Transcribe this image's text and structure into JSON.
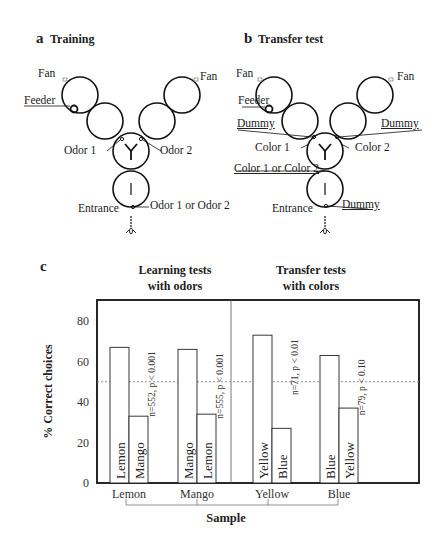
{
  "panel_a": {
    "letter": "a",
    "title": "Training",
    "labels": {
      "fan_left": "Fan",
      "fan_right": "Fan",
      "feeder": "Feeder",
      "odor1": "Odor 1",
      "odor2": "Odor 2",
      "entrance": "Entrance",
      "entrance_stim": "Odor 1 or Odor 2"
    }
  },
  "panel_b": {
    "letter": "b",
    "title": "Transfer test",
    "labels": {
      "fan_left": "Fan",
      "fan_right": "Fan",
      "feeder": "Feeder",
      "dummy_left": "Dummy",
      "dummy_right": "Dummy",
      "color1": "Color 1",
      "color2": "Color 2",
      "entrance_stim": "Color 1 or Color 2",
      "entrance": "Entrance",
      "entrance_dummy": "Dummy"
    }
  },
  "panel_c": {
    "letter": "c",
    "group_titles": {
      "left_line1": "Learning tests",
      "left_line2": "with odors",
      "right_line1": "Transfer tests",
      "right_line2": "with colors"
    }
  },
  "chart_data": {
    "type": "bar",
    "title": "",
    "xlabel": "Sample",
    "ylabel": "% Correct choices",
    "ylim": [
      0,
      90
    ],
    "yticks": [
      0,
      20,
      40,
      60,
      80
    ],
    "grid": false,
    "reference_line": {
      "y": 50,
      "style": "dashed"
    },
    "groups": [
      {
        "name": "Learning tests with odors",
        "categories": [
          "Lemon",
          "Mango"
        ]
      },
      {
        "name": "Transfer tests with colors",
        "categories": [
          "Yellow",
          "Blue"
        ]
      }
    ],
    "categories": [
      "Lemon",
      "Mango",
      "Yellow",
      "Blue"
    ],
    "bars": [
      {
        "sample": "Lemon",
        "pairs": [
          {
            "label": "Lemon",
            "value": 67
          },
          {
            "label": "Mango",
            "value": 33
          }
        ],
        "stat": "n=552, p < 0.001"
      },
      {
        "sample": "Mango",
        "pairs": [
          {
            "label": "Mango",
            "value": 66
          },
          {
            "label": "Lemon",
            "value": 34
          }
        ],
        "stat": "n=555, p < 0.001"
      },
      {
        "sample": "Yellow",
        "pairs": [
          {
            "label": "Yellow",
            "value": 73
          },
          {
            "label": "Blue",
            "value": 27
          }
        ],
        "stat": "n=71, p < 0.01"
      },
      {
        "sample": "Blue",
        "pairs": [
          {
            "label": "Blue",
            "value": 63
          },
          {
            "label": "Yellow",
            "value": 37
          }
        ],
        "stat": "n=79, p < 0.10"
      }
    ],
    "series": [
      {
        "name": "Choice matching sample",
        "values": [
          67,
          66,
          73,
          63
        ]
      },
      {
        "name": "Choice not matching sample",
        "values": [
          33,
          34,
          27,
          37
        ]
      }
    ],
    "legend": "none (bars labeled inline)"
  }
}
